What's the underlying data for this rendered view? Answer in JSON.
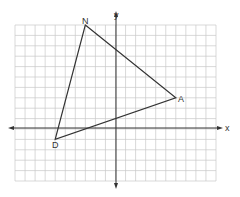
{
  "diagram": {
    "type": "coordinate-plane",
    "grid": {
      "columns": 20,
      "rows": 15,
      "x_min": -10,
      "x_max": 10,
      "y_min": -5,
      "y_max": 10
    },
    "axes": {
      "x_label": "x",
      "y_label": "y"
    },
    "polygon": {
      "name": "triangle NAD",
      "vertices": [
        {
          "label": "N",
          "x": -3,
          "y": 10
        },
        {
          "label": "A",
          "x": 6,
          "y": 3
        },
        {
          "label": "D",
          "x": -6,
          "y": -1
        }
      ]
    },
    "colors": {
      "grid": "#c8c8c8",
      "axis": "#333333",
      "triangle": "#333333",
      "background": "#ffffff"
    }
  }
}
